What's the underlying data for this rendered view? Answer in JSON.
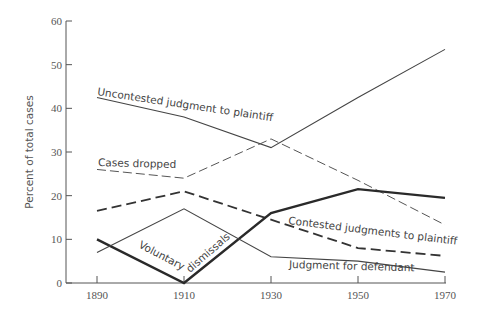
{
  "chart_data": {
    "type": "line",
    "title": "",
    "xlabel": "",
    "ylabel": "Percent of total cases",
    "x": [
      1890,
      1910,
      1930,
      1950,
      1970
    ],
    "x_tick_labels": [
      "1890",
      "1910",
      "1930",
      "1950",
      "1970"
    ],
    "y_tick_labels": [
      "0",
      "10",
      "20",
      "30",
      "40",
      "50",
      "60"
    ],
    "y_ticks": [
      0,
      10,
      20,
      30,
      40,
      50,
      60
    ],
    "ylim": [
      0,
      60
    ],
    "xlim": [
      1890,
      1970
    ],
    "grid": false,
    "legend": "inline labels",
    "series": [
      {
        "name": "Uncontested judgment to plaintiff",
        "style": "thin-solid",
        "values": [
          42.5,
          38,
          31,
          42.5,
          53.5
        ]
      },
      {
        "name": "Cases dropped",
        "style": "thin-dashed",
        "values": [
          26,
          24,
          33,
          23.5,
          13.3
        ]
      },
      {
        "name": "Contested judgments to plaintiff",
        "style": "heavy-dashed",
        "values": [
          16.5,
          21,
          14.5,
          8,
          6.2
        ]
      },
      {
        "name": "Voluntary dismissals",
        "style": "thick-solid",
        "values": [
          10,
          0,
          16,
          21.5,
          19.5
        ]
      },
      {
        "name": "Judgment for defendant",
        "style": "thin-solid",
        "values": [
          7,
          17,
          6,
          5,
          2.5
        ]
      }
    ],
    "annotations": [
      {
        "text": "Uncontested judgment to plaintiff",
        "series": 0
      },
      {
        "text": "Cases dropped",
        "series": 1
      },
      {
        "text": "Contested judgments to plaintiff",
        "series": 2
      },
      {
        "text": "Voluntary dismissals",
        "series": 3
      },
      {
        "text": "Judgment for defendant",
        "series": 4
      }
    ]
  }
}
